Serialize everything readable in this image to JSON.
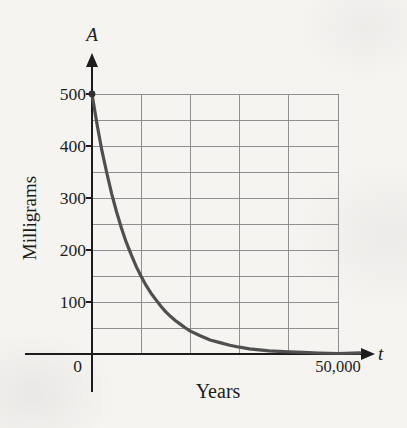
{
  "figure": {
    "y_axis_letter": "A",
    "x_axis_letter": "t",
    "origin_label": "0"
  },
  "chart_data": {
    "type": "line",
    "title": "",
    "xlabel": "Years",
    "ylabel": "Milligrams",
    "x_variable": "t",
    "y_variable": "A",
    "xlim": [
      0,
      50000
    ],
    "ylim": [
      0,
      500
    ],
    "grid": true,
    "x_gridline_step": 10000,
    "y_gridline_step": 50,
    "y_ticks": [
      {
        "value": 500,
        "label": "500"
      },
      {
        "value": 400,
        "label": "400"
      },
      {
        "value": 300,
        "label": "300"
      },
      {
        "value": 200,
        "label": "200"
      },
      {
        "value": 100,
        "label": "100"
      }
    ],
    "x_ticks": [
      {
        "value": 50000,
        "label": "50,000"
      }
    ],
    "start_point": {
      "t": 0,
      "A": 500
    },
    "curve_points": [
      [
        0,
        500
      ],
      [
        1000,
        443
      ],
      [
        2000,
        392
      ],
      [
        3000,
        348
      ],
      [
        4000,
        308
      ],
      [
        5000,
        273
      ],
      [
        6000,
        242
      ],
      [
        7000,
        214
      ],
      [
        8000,
        190
      ],
      [
        9000,
        168
      ],
      [
        10000,
        149
      ],
      [
        11000,
        132
      ],
      [
        12000,
        117
      ],
      [
        13000,
        104
      ],
      [
        14000,
        92
      ],
      [
        15000,
        81
      ],
      [
        16000,
        72
      ],
      [
        17000,
        64
      ],
      [
        18000,
        57
      ],
      [
        19000,
        50
      ],
      [
        20000,
        44
      ],
      [
        22000,
        35
      ],
      [
        24000,
        27
      ],
      [
        26000,
        22
      ],
      [
        28000,
        17
      ],
      [
        30000,
        13
      ],
      [
        32000,
        10
      ],
      [
        34000,
        8
      ],
      [
        36000,
        6
      ],
      [
        38000,
        5
      ],
      [
        40000,
        4
      ],
      [
        43000,
        3
      ],
      [
        46000,
        2
      ],
      [
        50000,
        1
      ]
    ],
    "colors": {
      "curve": "#4f4f4f",
      "axis": "#1c1c1c",
      "grid": "#8f8f8f",
      "background": "#f5f4f1",
      "start_dot": "#303030"
    }
  }
}
